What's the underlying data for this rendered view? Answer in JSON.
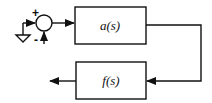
{
  "diagram": {
    "type": "feedback-block-diagram",
    "summing_junction": {
      "plus_sign": "+",
      "minus_sign": "-"
    },
    "forward_block": {
      "label": "a(s)"
    },
    "feedback_block": {
      "label": "f(s)"
    },
    "input_source": "ground-icon",
    "colors": {
      "stroke": "#111111",
      "background": "#ffffff"
    }
  }
}
